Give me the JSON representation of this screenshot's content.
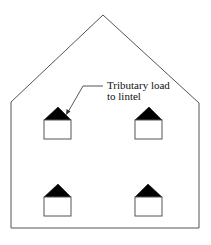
{
  "diagram": {
    "annotation": {
      "line1": "Tributary load",
      "line2": "to lintel"
    },
    "colors": {
      "outline": "#555555",
      "load_fill": "#000000",
      "background": "#ffffff"
    },
    "building": {
      "outline_points": "11,228 11,102 103,15 199,103 199,228"
    },
    "windows": [
      {
        "name": "window-top-left",
        "x": 44,
        "y": 120,
        "w": 27,
        "h": 19,
        "apex_x": 58,
        "apex_y": 107
      },
      {
        "name": "window-top-right",
        "x": 135,
        "y": 120,
        "w": 27,
        "h": 19,
        "apex_x": 149,
        "apex_y": 107
      },
      {
        "name": "window-bottom-left",
        "x": 44,
        "y": 197,
        "w": 27,
        "h": 19,
        "apex_x": 58,
        "apex_y": 184
      },
      {
        "name": "window-bottom-right",
        "x": 135,
        "y": 197,
        "w": 27,
        "h": 19,
        "apex_x": 148,
        "apex_y": 184
      }
    ]
  }
}
